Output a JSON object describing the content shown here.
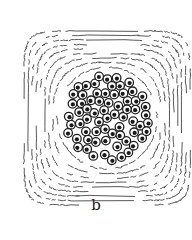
{
  "figure": {
    "panel_label": "b",
    "colors": {
      "ink": "#333333",
      "fill": "#ffffff",
      "nucleus": "#1a1a1a"
    },
    "bundle": {
      "cx": 107,
      "cy": 118,
      "rx": 46,
      "ry": 47,
      "cell_count": 130,
      "cell_radius": 4.3
    },
    "sheath": {
      "rings": 9,
      "frame": {
        "x": 22,
        "y": 24,
        "w": 162,
        "h": 168
      }
    }
  }
}
